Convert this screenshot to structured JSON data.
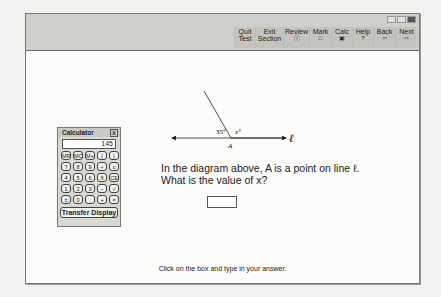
{
  "toolbar": {
    "buttons": [
      {
        "label_1": "Quit",
        "label_2": "Test",
        "icon": ""
      },
      {
        "label_1": "Exit",
        "label_2": "Section",
        "icon": ""
      },
      {
        "label_1": "Review",
        "label_2": "",
        "icon": "ⓘ"
      },
      {
        "label_1": "Mark",
        "label_2": "",
        "icon": "□"
      },
      {
        "label_1": "Calc",
        "label_2": "",
        "icon": "▣"
      },
      {
        "label_1": "Help",
        "label_2": "",
        "icon": "?"
      },
      {
        "label_1": "Back",
        "label_2": "",
        "icon": "⇦"
      },
      {
        "label_1": "Next",
        "label_2": "",
        "icon": "⇨"
      }
    ],
    "window_controls": [
      "minimize",
      "maximize",
      "close"
    ]
  },
  "calculator": {
    "title": "Calculator",
    "close": "X",
    "display": "145",
    "keys": [
      "MR",
      "MC",
      "M+",
      "(",
      ")",
      "7",
      "8",
      "9",
      "÷",
      "c",
      "4",
      "5",
      "6",
      "X",
      "CE",
      "1",
      "2",
      "3",
      "−",
      "√",
      "±",
      "0",
      ".",
      "+",
      "="
    ],
    "transfer": "Transfer Display"
  },
  "diagram": {
    "angle_label": "35°",
    "x_label": "x°",
    "point_label": "A",
    "line_label": "ℓ"
  },
  "question": {
    "line1": "In the diagram above, A is a point on line ℓ.",
    "line2": "What is the value of x?",
    "answer_value": ""
  },
  "hint": "Click on the box and type in your answer."
}
